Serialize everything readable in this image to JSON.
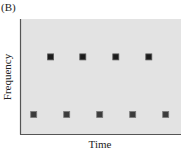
{
  "panel_label": "(B)",
  "chart_data": {
    "type": "scatter",
    "title": "",
    "xlabel": "Time",
    "ylabel": "Frequency",
    "xlim": [
      0,
      10
    ],
    "ylim": [
      0,
      1
    ],
    "x_ticks": [],
    "y_ticks": [],
    "grid": false,
    "legend": null,
    "marker": "square",
    "series": [
      {
        "name": "upper",
        "color": "#1c1c1c",
        "edge_color": "#5a5a5a",
        "points": [
          {
            "x": 1.9,
            "y": 0.67
          },
          {
            "x": 3.9,
            "y": 0.67
          },
          {
            "x": 5.95,
            "y": 0.67
          },
          {
            "x": 8.0,
            "y": 0.67
          }
        ]
      },
      {
        "name": "lower",
        "color": "#3c3c3c",
        "edge_color": "#7a7a7a",
        "points": [
          {
            "x": 0.85,
            "y": 0.17
          },
          {
            "x": 2.9,
            "y": 0.17
          },
          {
            "x": 4.95,
            "y": 0.17
          },
          {
            "x": 7.0,
            "y": 0.17
          },
          {
            "x": 9.05,
            "y": 0.17
          }
        ]
      }
    ],
    "plot_background": "#e3e3e3",
    "axis_color": "#555555"
  }
}
